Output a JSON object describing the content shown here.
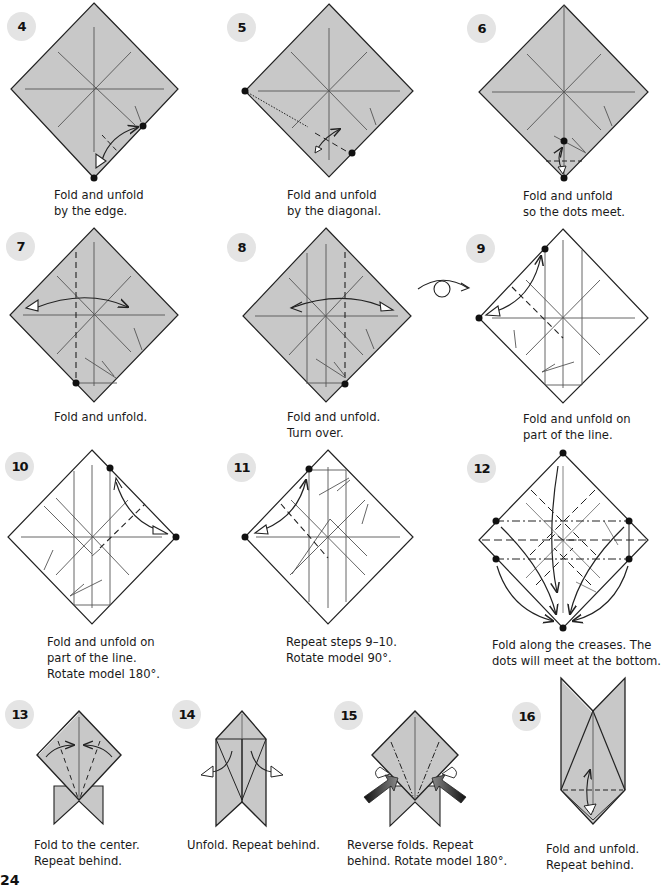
{
  "page": {
    "number": "24",
    "colors": {
      "paper_colored": "#c8c8c8",
      "paper_white": "#ffffff",
      "line": "#222222",
      "crease": "#555555",
      "badge_bg": "#e4e4e4"
    }
  },
  "steps": [
    {
      "number": "4",
      "caption": [
        "Fold and unfold",
        "by the edge."
      ]
    },
    {
      "number": "5",
      "caption": [
        "Fold and unfold",
        "by the diagonal."
      ]
    },
    {
      "number": "6",
      "caption": [
        "Fold and unfold",
        "so the dots meet."
      ]
    },
    {
      "number": "7",
      "caption": [
        "Fold and unfold."
      ]
    },
    {
      "number": "8",
      "caption": [
        "Fold and unfold.",
        "Turn over."
      ]
    },
    {
      "number": "9",
      "caption": [
        "Fold and unfold on",
        "part of the line."
      ]
    },
    {
      "number": "10",
      "caption": [
        "Fold and unfold on",
        "part of the line.",
        "Rotate model 180°."
      ]
    },
    {
      "number": "11",
      "caption": [
        "Repeat steps 9–10.",
        "Rotate model 90°."
      ]
    },
    {
      "number": "12",
      "caption": [
        "Fold along the creases. The",
        "dots will meet at the bottom."
      ]
    },
    {
      "number": "13",
      "caption": [
        "Fold to the center.",
        "Repeat behind."
      ]
    },
    {
      "number": "14",
      "caption": [
        "Unfold. Repeat behind."
      ]
    },
    {
      "number": "15",
      "caption": [
        "Reverse folds. Repeat",
        "behind. Rotate model 180°."
      ]
    },
    {
      "number": "16",
      "caption": [
        "Fold and unfold.",
        "Repeat behind."
      ]
    }
  ],
  "symbols": {
    "turn_over": "turn-over-icon"
  }
}
